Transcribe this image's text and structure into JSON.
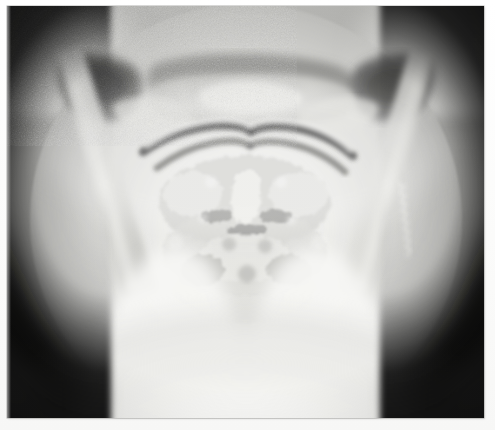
{
  "document": {
    "kind": "photographic-print",
    "modality": "radiograph",
    "caption": "",
    "visible_text": []
  },
  "print": {
    "background_color": "#ffffff",
    "border_color": "#78787620",
    "x": 7,
    "y": 6,
    "width": 477,
    "height": 412
  },
  "radiograph": {
    "title": "",
    "view": "open-mouth odontoid anteroposterior cervical spine radiograph",
    "collimation": "circular",
    "tone": "grayscale",
    "grain": "coarse photographic grain",
    "colors": {
      "film_base": "#a9a9a6",
      "bright_field": "#f6f6f4",
      "collimation_shadow": "#0c0c0c",
      "soft_tissue_white": "#fcfcfa",
      "bone_mid": "#d8d8d4",
      "air_dark": "#4a4a48",
      "paper_white": "#ffffff"
    },
    "regions": [
      {
        "name": "collimation-shadow-left",
        "description": "dark crescent of unexposed film along the left border"
      },
      {
        "name": "collimation-shadow-right",
        "description": "dark crescent of unexposed film along the right border"
      },
      {
        "name": "skull-base",
        "description": "upper central bony mass, petrous ridges and maxilla"
      },
      {
        "name": "dental-arch",
        "description": "paired dark arching bands crossing the midline in the upper third"
      },
      {
        "name": "mandible-ramus-left",
        "description": "oblique bright bar descending at the left"
      },
      {
        "name": "mandible-ramus-right",
        "description": "oblique bright bar descending at the right with serrated dental margin"
      },
      {
        "name": "cervical-vertebrae",
        "description": "mottled central column of vertebral bodies below the dental arch"
      },
      {
        "name": "odontoid-process",
        "description": "central lucent peg between the lateral masses"
      },
      {
        "name": "soft-tissue-shoulders",
        "description": "broad bright soft-tissue mass filling the lower half"
      },
      {
        "name": "mastoid-air-cells-left",
        "description": "dark lobulated air cells upper left"
      },
      {
        "name": "mastoid-air-cells-right",
        "description": "dark lobulated air cells upper right"
      }
    ]
  }
}
